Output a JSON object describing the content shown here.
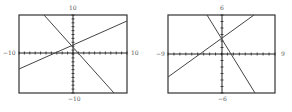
{
  "chart_data": [
    {
      "type": "line",
      "title": "",
      "window": {
        "xmin": -10,
        "xmax": 10,
        "ymin": -10,
        "ymax": 10
      },
      "tick_labels": {
        "top": "10",
        "bottom": "−10",
        "left": "−10",
        "right": "10"
      },
      "xlim": [
        -10,
        10
      ],
      "ylim": [
        -10,
        10
      ],
      "grid": false,
      "axis_ticks": "unit ticks along both axes",
      "series": [
        {
          "name": "rising line",
          "x": [
            -10,
            10
          ],
          "y": [
            -3.8,
            8.5
          ]
        },
        {
          "name": "falling line",
          "x": [
            -5.4,
            7.6
          ],
          "y": [
            10,
            -10
          ]
        }
      ],
      "intersection_approx": {
        "x": -0.2,
        "y": 2.3
      }
    },
    {
      "type": "line",
      "title": "",
      "window": {
        "xmin": -9,
        "xmax": 9,
        "ymin": -6,
        "ymax": 6
      },
      "tick_labels": {
        "top": "6",
        "bottom": "−6",
        "left": "−9",
        "right": "9"
      },
      "xlim": [
        -9,
        9
      ],
      "ylim": [
        -6,
        6
      ],
      "grid": false,
      "axis_ticks": "unit ticks along both axes",
      "series": [
        {
          "name": "rising line",
          "x": [
            -9,
            5.4
          ],
          "y": [
            -3.5,
            6
          ]
        },
        {
          "name": "falling line",
          "x": [
            -2.5,
            5.5
          ],
          "y": [
            6,
            -6
          ]
        }
      ],
      "intersection_approx": {
        "x": -0.3,
        "y": 2.4
      }
    }
  ],
  "colors": {
    "frame": "#333333",
    "axes": "#222222",
    "lines": "#444444",
    "labels": "#555555"
  }
}
